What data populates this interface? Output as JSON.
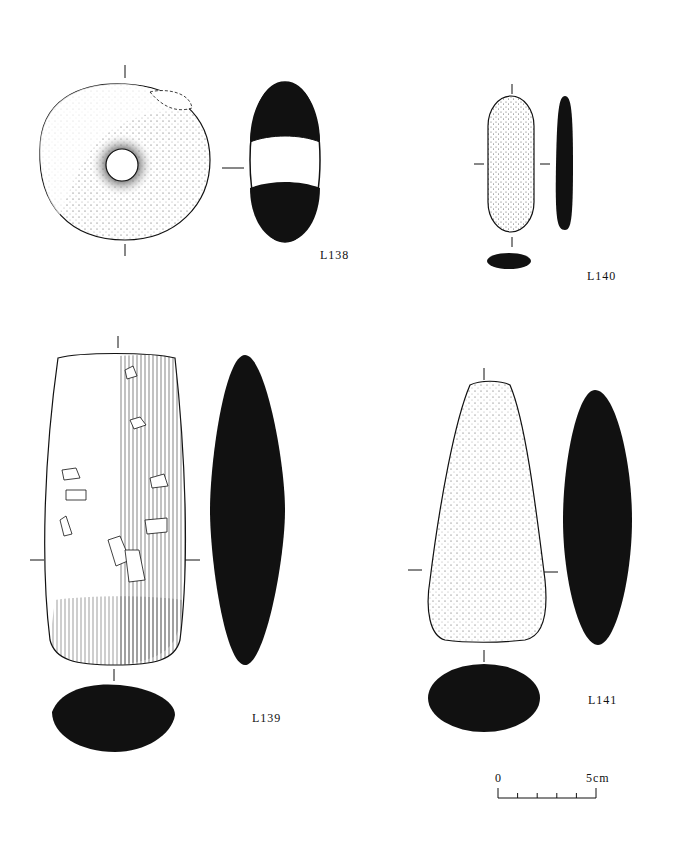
{
  "plate": {
    "artifacts": [
      {
        "id": "L138",
        "label": "L138",
        "description": "perforated stone disc (mace-head / spindle whorl) with section"
      },
      {
        "id": "L140",
        "label": "L140",
        "description": "elongated small stone with side and cross sections"
      },
      {
        "id": "L139",
        "label": "L139",
        "description": "polished stone axe with striated surface, side and cross sections"
      },
      {
        "id": "L141",
        "label": "L141",
        "description": "stippled stone axe with side and cross sections"
      }
    ],
    "scale_bar": {
      "start_label": "0",
      "end_label": "5cm",
      "divisions": 5
    },
    "colors": {
      "ink": "#111111",
      "paper": "#ffffff"
    }
  }
}
